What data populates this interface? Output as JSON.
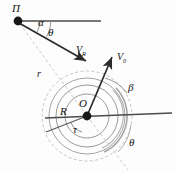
{
  "figure": {
    "background_color": "#fdfdfd",
    "stroke_color": "#333333",
    "faint_color": "#b9b9b9",
    "width": 175,
    "height": 174
  },
  "labels": {
    "point_p": "П",
    "angle_alpha": "α",
    "angle_theta_top": "θ",
    "vector_vr": "V",
    "vector_vr_sub": "R",
    "radius_r_lower": "r",
    "vector_v0": "V",
    "vector_v0_sub": "0",
    "angle_beta": "β",
    "center_o": "O",
    "radius_R": "R",
    "angle_tau": "τ",
    "angle_theta_bottom": "θ"
  },
  "geometry": {
    "point_p": {
      "x": 18,
      "y": 21
    },
    "center_o": {
      "x": 87,
      "y": 116
    },
    "horizontal_top": {
      "x1": 18,
      "y1": 21,
      "x2": 101,
      "y2": 21
    },
    "horizontal_center": {
      "x1": 45,
      "y1": 117,
      "x2": 172,
      "y2": 113
    },
    "vector_vr": {
      "x1": 18,
      "y1": 21,
      "x2": 89,
      "y2": 64
    },
    "vector_v0": {
      "x1": 87,
      "y1": 116,
      "x2": 112,
      "y2": 54
    },
    "dashed_r_line": {
      "x1": 18,
      "y1": 21,
      "x2": 87,
      "y2": 116
    },
    "dashed_tail_line": {
      "x1": 87,
      "y1": 116,
      "x2": 126,
      "y2": 166
    },
    "tangent_line": {
      "x1": 48,
      "y1": 131,
      "x2": 87,
      "y2": 116
    },
    "circles": [
      {
        "name": "inner-solid",
        "radius": 22
      },
      {
        "name": "middle-solid",
        "radius": 31
      },
      {
        "name": "outer-solid",
        "radius": 38
      },
      {
        "name": "outer-dashed",
        "radius": 45
      }
    ],
    "arcs": {
      "alpha_radius": 22,
      "theta_top_radius": 33,
      "beta_radius": 41,
      "tau_radius": 17
    }
  }
}
